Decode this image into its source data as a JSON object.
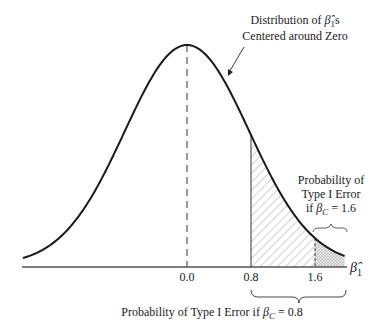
{
  "figure": {
    "type": "normal-distribution-diagram",
    "distribution": {
      "mean": 0.0,
      "sd": 0.78,
      "x_range": [
        -2.05,
        1.97
      ]
    },
    "axis": {
      "variable": "β̂",
      "variable_subscript": "1",
      "ticks": [
        {
          "value": 0.0,
          "label": "0.0"
        },
        {
          "value": 0.8,
          "label": "0.8"
        },
        {
          "value": 1.6,
          "label": "1.6"
        }
      ]
    },
    "annotations": {
      "top": {
        "line1_prefix": "Distribution of ",
        "line1_symbol": "β̂",
        "line1_subscript": "1",
        "line1_suffix": "s",
        "line2": "Centered around Zero"
      },
      "right": {
        "line1": "Probability of",
        "line2": "Type I Error",
        "line3_prefix": "if ",
        "line3_symbol": "β",
        "line3_subscript": "C",
        "line3_suffix": " = 1.6"
      },
      "bottom": {
        "prefix": "Probability of Type I Error if ",
        "symbol": "β",
        "subscript": "C",
        "suffix": " = 0.8"
      }
    },
    "shaded_regions": [
      {
        "from": 0.8,
        "to": 1.6,
        "pattern": "diagonal-hatch"
      },
      {
        "from": 1.6,
        "to": 1.97,
        "pattern": "stipple"
      }
    ],
    "critical_values": [
      0.8,
      1.6
    ]
  }
}
